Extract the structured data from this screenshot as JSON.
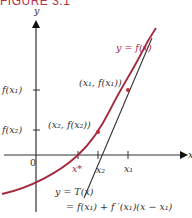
{
  "figure": {
    "title": "FIGURE 3.1",
    "colors": {
      "curve": "#a3283a",
      "axis": "#333333",
      "tangent": "#333333",
      "title": "#b3323f",
      "point": "#c0283a"
    },
    "axes": {
      "y_label": "y",
      "x_label": "x",
      "origin_label": "0"
    },
    "curve_label": "y = f(x)",
    "y_ticks": [
      {
        "label": "f(x₁)"
      },
      {
        "label": "f(x₂)"
      }
    ],
    "x_ticks": [
      {
        "label": "x*",
        "color": "red"
      },
      {
        "label": "x₂"
      },
      {
        "label": "x₁"
      }
    ],
    "points": [
      {
        "label": "(x₁, f(x₁))"
      },
      {
        "label": "(x₂, f(x₂))"
      }
    ],
    "tangent_label_line1": "y = T(x)",
    "tangent_label_line2": "= f(x₁) + f ′(x₁)(x − x₁)"
  }
}
